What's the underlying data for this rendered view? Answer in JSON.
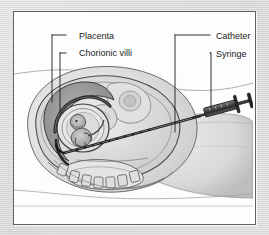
{
  "figure": {
    "kind": "medical-illustration",
    "background_color": "#dcdcdc",
    "panel_color": "#fdfdfd",
    "frame_color": "#5f6265",
    "ink_color": "#1b1b1b"
  },
  "labels": [
    {
      "id": "placenta",
      "text": "Placenta"
    },
    {
      "id": "chorionic_villi",
      "text": "Chorionic villi"
    },
    {
      "id": "catheter",
      "text": "Catheter"
    },
    {
      "id": "syringe",
      "text": "Syringe"
    }
  ],
  "anatomy": [
    {
      "id": "abdomen-contour-upper",
      "name": "upper abdominal skin contour"
    },
    {
      "id": "abdomen-contour-lower",
      "name": "lower body / thigh contour"
    },
    {
      "id": "uterus-wall",
      "name": "uterine wall"
    },
    {
      "id": "amniotic-sac",
      "name": "amniotic sac"
    },
    {
      "id": "fetus",
      "name": "fetus"
    },
    {
      "id": "placenta-mass",
      "name": "placental mass"
    },
    {
      "id": "spine-vertebrae",
      "name": "maternal spine / vertebrae"
    },
    {
      "id": "bladder",
      "name": "bladder"
    },
    {
      "id": "cervical-canal",
      "name": "cervical canal"
    }
  ],
  "instruments": [
    {
      "id": "catheter-tube",
      "name": "flexible sampling catheter"
    },
    {
      "id": "syringe-body",
      "name": "syringe barrel"
    },
    {
      "id": "syringe-plunger",
      "name": "syringe plunger and flange"
    }
  ]
}
